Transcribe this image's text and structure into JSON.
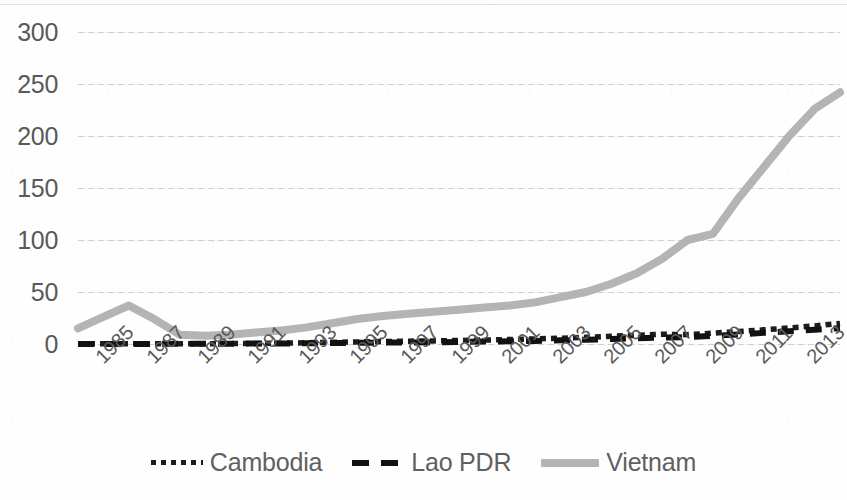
{
  "chart_data": {
    "type": "line",
    "title": "",
    "subtitle": "",
    "xlabel": "",
    "ylabel": "",
    "xlim": [
      1985,
      2015
    ],
    "ylim": [
      0,
      300
    ],
    "ytick_values": [
      0,
      50,
      100,
      150,
      200,
      250,
      300
    ],
    "ytick_labels": [
      "0",
      "50",
      "100",
      "150",
      "200",
      "250",
      "300"
    ],
    "xtick_labels": [
      "1985",
      "1987",
      "1989",
      "1991",
      "1993",
      "1995",
      "1997",
      "1999",
      "2001",
      "2003",
      "2005",
      "2007",
      "2009",
      "2011",
      "2013",
      "2015"
    ],
    "grid": "horizontal",
    "legend_position": "bottom",
    "x": [
      1985,
      1986,
      1987,
      1988,
      1989,
      1990,
      1991,
      1992,
      1993,
      1994,
      1995,
      1996,
      1997,
      1998,
      1999,
      2000,
      2001,
      2002,
      2003,
      2004,
      2005,
      2006,
      2007,
      2008,
      2009,
      2010,
      2011,
      2012,
      2013,
      2014,
      2015
    ],
    "series": [
      {
        "name": "Cambodia",
        "color": "#1c1c1c",
        "style": "dotted",
        "values": [
          0.2,
          0.2,
          0.2,
          0.2,
          0.3,
          0.3,
          0.4,
          0.5,
          0.8,
          1.2,
          1.6,
          2.0,
          2.4,
          2.7,
          3.0,
          3.4,
          3.8,
          4.3,
          4.9,
          5.6,
          6.4,
          7.4,
          8.4,
          9.4,
          9.0,
          10.4,
          12.0,
          13.6,
          15.4,
          17.4,
          19.8
        ]
      },
      {
        "name": "Lao PDR",
        "color": "#111111",
        "style": "dashed",
        "values": [
          0.1,
          0.1,
          0.1,
          0.1,
          0.2,
          0.2,
          0.3,
          0.4,
          0.5,
          0.7,
          0.9,
          1.1,
          1.3,
          1.5,
          1.7,
          2.0,
          2.3,
          2.6,
          3.0,
          3.5,
          4.1,
          4.8,
          5.5,
          6.3,
          6.6,
          7.8,
          9.2,
          10.7,
          12.2,
          13.7,
          15.2
        ]
      },
      {
        "name": "Vietnam",
        "color": "#b4b4b4",
        "style": "solid",
        "values": [
          15,
          26,
          37,
          24,
          9,
          8,
          9,
          11,
          13,
          16,
          20,
          24,
          27,
          29,
          31,
          33,
          35,
          37,
          40,
          45,
          50,
          58,
          68,
          82,
          100,
          106,
          140,
          170,
          200,
          226,
          242
        ]
      }
    ]
  },
  "legend": {
    "items": [
      {
        "label": "Cambodia",
        "swatch": "dotted-line-swatch"
      },
      {
        "label": "Lao PDR",
        "swatch": "dashed-line-swatch"
      },
      {
        "label": "Vietnam",
        "swatch": "solid-thick-line-swatch"
      }
    ]
  }
}
